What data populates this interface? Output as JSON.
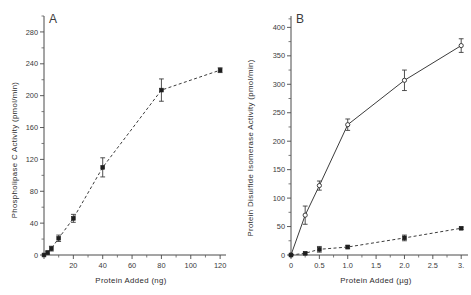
{
  "figure": {
    "panel_a_letter": "A",
    "panel_b_letter": "B"
  },
  "chart_data": [
    {
      "type": "line",
      "panel": "A",
      "title": "",
      "xlabel": "Protein Added (ng)",
      "ylabel": "Phospholipase C Activity (pmol/min)",
      "xlim": [
        0,
        124
      ],
      "ylim": [
        0,
        300
      ],
      "xticks": [
        0,
        20,
        40,
        60,
        80,
        100,
        120
      ],
      "xtick_labels": [
        "",
        "20",
        "40",
        "60",
        "80",
        "100",
        "120"
      ],
      "xticks_minor": [
        10,
        30,
        50,
        70,
        90,
        110
      ],
      "yticks": [
        0,
        40,
        80,
        120,
        160,
        200,
        240,
        280
      ],
      "ytick_labels": [
        "0",
        "40",
        "80",
        "120",
        "160",
        "200",
        "240",
        "280"
      ],
      "yticks_minor": [
        20,
        60,
        100,
        140,
        180,
        220,
        260,
        300
      ],
      "grid": false,
      "legend": "none",
      "series": [
        {
          "name": "Phospholipase C Activity",
          "marker": "filled-square",
          "line": "dashed",
          "x": [
            0,
            2.5,
            5,
            10,
            20,
            40,
            80,
            120
          ],
          "values": [
            0,
            3,
            8,
            21,
            46,
            110,
            207,
            232
          ],
          "errors": [
            0,
            2,
            3,
            4,
            5,
            12,
            14,
            3
          ]
        }
      ]
    },
    {
      "type": "line",
      "panel": "B",
      "title": "",
      "xlabel": "Protein Added (µg)",
      "ylabel": "Protein Disulfide Isomerase Activity (pmol/min)",
      "xlim": [
        0,
        3.12
      ],
      "ylim": [
        0,
        420
      ],
      "xticks": [
        0,
        0.5,
        1.0,
        1.5,
        2.0,
        2.5,
        3.0
      ],
      "xtick_labels": [
        "0",
        "0.5",
        "1.0",
        "1.5",
        "2.0",
        "2.5",
        "3."
      ],
      "xticks_minor": [
        0.25,
        0.75,
        1.25,
        1.75,
        2.25,
        2.75
      ],
      "yticks": [
        0,
        50,
        100,
        150,
        200,
        250,
        300,
        350,
        400
      ],
      "ytick_labels": [
        "0",
        "50",
        "100",
        "150",
        "200",
        "250",
        "300",
        "350",
        "400"
      ],
      "yticks_minor": [
        25,
        75,
        125,
        175,
        225,
        275,
        325,
        375,
        415
      ],
      "grid": false,
      "legend": "none",
      "series": [
        {
          "name": "PDI activity (solid, open circles)",
          "marker": "open-circle",
          "line": "solid",
          "x": [
            0,
            0.25,
            0.5,
            1.0,
            2.0,
            3.0
          ],
          "values": [
            0,
            70,
            122,
            229,
            307,
            368
          ],
          "errors": [
            0,
            16,
            8,
            10,
            18,
            12
          ]
        },
        {
          "name": "Control (dashed, filled squares)",
          "marker": "filled-square",
          "line": "dashed",
          "x": [
            0,
            0.25,
            0.5,
            1.0,
            2.0,
            3.0
          ],
          "values": [
            0,
            3,
            10,
            14,
            30,
            47
          ],
          "errors": [
            0,
            2,
            5,
            3,
            5,
            2
          ]
        }
      ]
    }
  ]
}
